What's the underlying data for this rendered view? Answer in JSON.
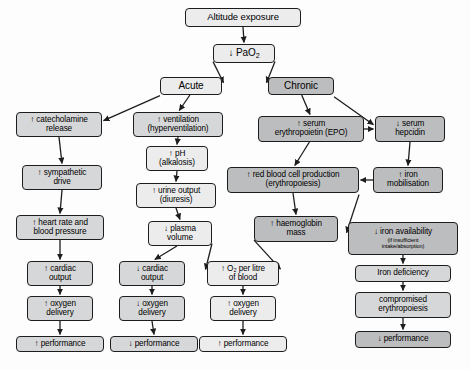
{
  "diagram": {
    "colors": {
      "box_light": "#ececed",
      "box_mid": "#d6d7d8",
      "box_dark": "#bcbdbe",
      "border": "#1d1d1d",
      "arrow": "#1d1d1d",
      "background": "#fdfdfd"
    },
    "nodes": [
      {
        "id": "altitude",
        "line1": "Altitude exposure",
        "line2": "",
        "sub": "",
        "tone": "light",
        "x": 185,
        "y": 8,
        "w": 116,
        "h": 19,
        "fs": 9.5
      },
      {
        "id": "pao2",
        "line1": "↓ PaO",
        "line2": "",
        "sub": "",
        "tone": "light",
        "x": 213,
        "y": 44,
        "w": 62,
        "h": 19,
        "fs": 10,
        "subscript": "2"
      },
      {
        "id": "acute",
        "line1": "Acute",
        "line2": "",
        "sub": "",
        "tone": "light",
        "x": 160,
        "y": 77,
        "w": 62,
        "h": 18,
        "fs": 10
      },
      {
        "id": "chronic",
        "line1": "Chronic",
        "line2": "",
        "sub": "",
        "tone": "dark",
        "x": 268,
        "y": 77,
        "w": 66,
        "h": 18,
        "fs": 10
      },
      {
        "id": "catecholamine",
        "line1": "↑ catecholamine",
        "line2": "release",
        "sub": "",
        "tone": "mid",
        "x": 16,
        "y": 112,
        "w": 86,
        "h": 25,
        "fs": 8.2
      },
      {
        "id": "sympathetic",
        "line1": "↑ sympathetic",
        "line2": "drive",
        "sub": "",
        "tone": "mid",
        "x": 22,
        "y": 165,
        "w": 80,
        "h": 25,
        "fs": 8.2
      },
      {
        "id": "heartrate",
        "line1": "↑ heart rate and",
        "line2": "blood pressure",
        "sub": "",
        "tone": "mid",
        "x": 16,
        "y": 215,
        "w": 88,
        "h": 25,
        "fs": 8.2
      },
      {
        "id": "cardiac-up",
        "line1": "↑ cardiac",
        "line2": "output",
        "sub": "",
        "tone": "mid",
        "x": 27,
        "y": 261,
        "w": 66,
        "h": 25,
        "fs": 8.2
      },
      {
        "id": "oxygen-up",
        "line1": "↑ oxygen",
        "line2": "delivery",
        "sub": "",
        "tone": "mid",
        "x": 27,
        "y": 296,
        "w": 66,
        "h": 25,
        "fs": 8.2
      },
      {
        "id": "perf-up-1",
        "line1": "↑ performance",
        "line2": "",
        "sub": "",
        "tone": "mid",
        "x": 16,
        "y": 336,
        "w": 88,
        "h": 16,
        "fs": 8.2
      },
      {
        "id": "ventilation",
        "line1": "↑ ventilation",
        "line2": "(hyperventilation)",
        "sub": "",
        "tone": "mid",
        "x": 133,
        "y": 112,
        "w": 90,
        "h": 25,
        "fs": 8.2
      },
      {
        "id": "ph",
        "line1": "↑ pH",
        "line2": "(alkalosis)",
        "sub": "",
        "tone": "light",
        "x": 146,
        "y": 146,
        "w": 62,
        "h": 25,
        "fs": 8.2
      },
      {
        "id": "urine",
        "line1": "↑ urine output",
        "line2": "(diuresis)",
        "sub": "",
        "tone": "light",
        "x": 136,
        "y": 183,
        "w": 80,
        "h": 25,
        "fs": 8.2
      },
      {
        "id": "plasma",
        "line1": "↓ plasma",
        "line2": "volume",
        "sub": "",
        "tone": "light",
        "x": 148,
        "y": 221,
        "w": 64,
        "h": 25,
        "fs": 8.2
      },
      {
        "id": "cardiac-down",
        "line1": "↓ cardiac",
        "line2": "output",
        "sub": "",
        "tone": "mid",
        "x": 119,
        "y": 261,
        "w": 66,
        "h": 25,
        "fs": 8.2
      },
      {
        "id": "oxygen-down",
        "line1": "↓ oxygen",
        "line2": "delivery",
        "sub": "",
        "tone": "mid",
        "x": 119,
        "y": 296,
        "w": 66,
        "h": 25,
        "fs": 8.2
      },
      {
        "id": "perf-down-1",
        "line1": "↓ performance",
        "line2": "",
        "sub": "",
        "tone": "mid",
        "x": 110,
        "y": 336,
        "w": 88,
        "h": 16,
        "fs": 8.2
      },
      {
        "id": "o2-litre",
        "line1": "↑ O₂ per litre",
        "line2": "of blood",
        "sub": "",
        "tone": "light",
        "x": 207,
        "y": 261,
        "w": 72,
        "h": 25,
        "fs": 8.2
      },
      {
        "id": "oxygen-up-2",
        "line1": "↑ oxygen",
        "line2": "delivery",
        "sub": "",
        "tone": "light",
        "x": 210,
        "y": 296,
        "w": 66,
        "h": 25,
        "fs": 8.2
      },
      {
        "id": "perf-up-2",
        "line1": "↑ performance",
        "line2": "",
        "sub": "",
        "tone": "light",
        "x": 199,
        "y": 336,
        "w": 88,
        "h": 16,
        "fs": 8.2
      },
      {
        "id": "epo",
        "line1": "↑ serum",
        "line2": "erythropoietin (EPO)",
        "sub": "",
        "tone": "dark",
        "x": 258,
        "y": 116,
        "w": 106,
        "h": 26,
        "fs": 8.2
      },
      {
        "id": "hepcidin",
        "line1": "↓ serum",
        "line2": "hepcidin",
        "sub": "",
        "tone": "dark",
        "x": 375,
        "y": 116,
        "w": 70,
        "h": 26,
        "fs": 8.2
      },
      {
        "id": "rbc",
        "line1": "↑ red blood cell production",
        "line2": "(erythropoiesis)",
        "sub": "",
        "tone": "dark",
        "x": 227,
        "y": 167,
        "w": 132,
        "h": 26,
        "fs": 8.2
      },
      {
        "id": "iron-mob",
        "line1": "↑ iron",
        "line2": "mobilisation",
        "sub": "",
        "tone": "dark",
        "x": 373,
        "y": 167,
        "w": 70,
        "h": 26,
        "fs": 8.2
      },
      {
        "id": "haemoglobin",
        "line1": "↑ haemoglobin",
        "line2": "mass",
        "sub": "",
        "tone": "dark",
        "x": 254,
        "y": 216,
        "w": 84,
        "h": 26,
        "fs": 8.2
      },
      {
        "id": "iron-avail",
        "line1": "↓ iron availability",
        "line2": "",
        "sub": "(if insufficient|intake/absorption)",
        "tone": "dark",
        "x": 348,
        "y": 222,
        "w": 110,
        "h": 33,
        "fs": 8.2
      },
      {
        "id": "iron-def",
        "line1": "Iron deficiency",
        "line2": "",
        "sub": "",
        "tone": "mid",
        "x": 355,
        "y": 265,
        "w": 96,
        "h": 17,
        "fs": 8.2
      },
      {
        "id": "compromised",
        "line1": "compromised",
        "line2": "erythropoiesis",
        "sub": "",
        "tone": "mid",
        "x": 355,
        "y": 292,
        "w": 96,
        "h": 26,
        "fs": 8.2
      },
      {
        "id": "perf-down-2",
        "line1": "↓ performance",
        "line2": "",
        "sub": "",
        "tone": "dark",
        "x": 355,
        "y": 331,
        "w": 96,
        "h": 17,
        "fs": 8.2
      }
    ],
    "edges": [
      {
        "id": "altitude-to-pao2",
        "from": "altitude",
        "to": "pao2"
      },
      {
        "id": "pao2-to-acute",
        "from": "pao2",
        "to": "acute"
      },
      {
        "id": "pao2-to-chronic",
        "from": "pao2",
        "to": "chronic"
      },
      {
        "id": "acute-to-catecholamine",
        "from": "acute",
        "to": "catecholamine"
      },
      {
        "id": "acute-to-ventilation",
        "from": "acute",
        "to": "ventilation"
      },
      {
        "id": "catecholamine-to-sympathetic",
        "from": "catecholamine",
        "to": "sympathetic"
      },
      {
        "id": "sympathetic-to-heartrate",
        "from": "sympathetic",
        "to": "heartrate"
      },
      {
        "id": "heartrate-to-cardiac-up",
        "from": "heartrate",
        "to": "cardiac-up"
      },
      {
        "id": "cardiac-up-to-oxygen-up",
        "from": "cardiac-up",
        "to": "oxygen-up"
      },
      {
        "id": "oxygen-up-to-perf",
        "from": "oxygen-up",
        "to": "perf-up-1"
      },
      {
        "id": "ventilation-to-ph",
        "from": "ventilation",
        "to": "ph"
      },
      {
        "id": "ph-to-urine",
        "from": "ph",
        "to": "urine"
      },
      {
        "id": "urine-to-plasma",
        "from": "urine",
        "to": "plasma"
      },
      {
        "id": "plasma-to-cardiac-down",
        "from": "plasma",
        "to": "cardiac-down"
      },
      {
        "id": "plasma-to-o2-litre",
        "from": "plasma",
        "to": "o2-litre"
      },
      {
        "id": "cardiac-down-to-oxygen-down",
        "from": "cardiac-down",
        "to": "oxygen-down"
      },
      {
        "id": "oxygen-down-to-perf",
        "from": "oxygen-down",
        "to": "perf-down-1"
      },
      {
        "id": "o2-litre-to-oxygen-up2",
        "from": "o2-litre",
        "to": "oxygen-up-2"
      },
      {
        "id": "oxygen-up2-to-perf",
        "from": "oxygen-up-2",
        "to": "perf-up-2"
      },
      {
        "id": "chronic-to-epo",
        "from": "chronic",
        "to": "epo"
      },
      {
        "id": "chronic-to-hepcidin",
        "from": "chronic",
        "to": "hepcidin"
      },
      {
        "id": "epo-to-hepcidin",
        "from": "epo",
        "to": "hepcidin"
      },
      {
        "id": "epo-to-rbc",
        "from": "epo",
        "to": "rbc"
      },
      {
        "id": "hepcidin-to-iron-mob",
        "from": "hepcidin",
        "to": "iron-mob"
      },
      {
        "id": "iron-mob-to-rbc",
        "from": "iron-mob",
        "to": "rbc"
      },
      {
        "id": "rbc-to-haemoglobin",
        "from": "rbc",
        "to": "haemoglobin"
      },
      {
        "id": "rbc-to-iron-avail",
        "from": "rbc",
        "to": "iron-avail"
      },
      {
        "id": "haemoglobin-to-o2-litre",
        "from": "haemoglobin",
        "to": "o2-litre"
      },
      {
        "id": "iron-avail-to-iron-def",
        "from": "iron-avail",
        "to": "iron-def"
      },
      {
        "id": "iron-def-to-compromised",
        "from": "iron-def",
        "to": "compromised"
      },
      {
        "id": "compromised-to-perf",
        "from": "compromised",
        "to": "perf-down-2"
      }
    ]
  }
}
